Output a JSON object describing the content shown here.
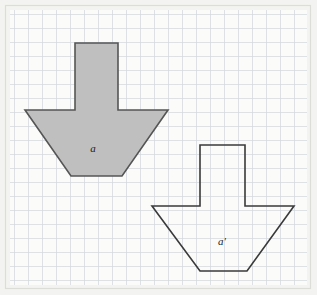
{
  "figure": {
    "background_color": "#f2f2f0",
    "canvas": {
      "width": 317,
      "height": 295
    },
    "grid": {
      "visible": true,
      "cell_size": 14,
      "line_color": "#cfd3d8",
      "line_color_minor": "#e2e5e8",
      "origin_x": 10,
      "origin_y": 10,
      "area": {
        "x": 10,
        "y": 10,
        "width": 297,
        "height": 275
      }
    },
    "border": {
      "visible": true,
      "color": "#d8d8d4"
    },
    "shapes": [
      {
        "name": "arrow-original",
        "label": "a",
        "label_x": 93,
        "label_y": 152,
        "fill": "#bfbfbf",
        "stroke": "#555555",
        "stroke_width": 1.6,
        "points": "75,43 118,43 118,110 168,110 122,176 71,176 25,110 75,110",
        "vertices": [
          {
            "x": 75,
            "y": 43
          },
          {
            "x": 118,
            "y": 43
          },
          {
            "x": 118,
            "y": 110
          },
          {
            "x": 168,
            "y": 110
          },
          {
            "x": 122,
            "y": 176
          },
          {
            "x": 71,
            "y": 176
          },
          {
            "x": 25,
            "y": 110
          },
          {
            "x": 75,
            "y": 110
          }
        ]
      },
      {
        "name": "arrow-image",
        "label": "a'",
        "label_x": 222,
        "label_y": 245,
        "fill": "none",
        "stroke": "#3a3a3a",
        "stroke_width": 1.6,
        "points": "200,145 245,145 245,206 294,206 247,271 200,271 152,206 200,206",
        "vertices": [
          {
            "x": 200,
            "y": 145
          },
          {
            "x": 245,
            "y": 145
          },
          {
            "x": 245,
            "y": 206
          },
          {
            "x": 294,
            "y": 206
          },
          {
            "x": 247,
            "y": 271
          },
          {
            "x": 200,
            "y": 271
          },
          {
            "x": 152,
            "y": 206
          },
          {
            "x": 200,
            "y": 206
          }
        ]
      }
    ]
  }
}
